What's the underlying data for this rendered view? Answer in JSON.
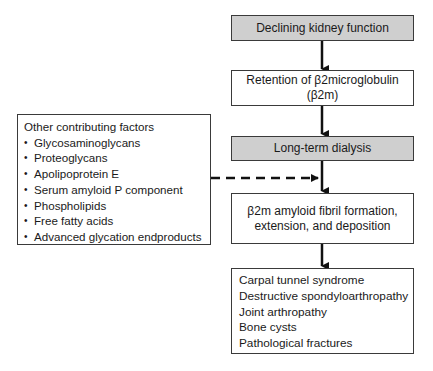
{
  "diagram": {
    "nodes": [
      {
        "id": "declining",
        "label": "Declining kidney function",
        "shaded": true
      },
      {
        "id": "retention",
        "label": "Retention of β2microglobulin (β2m)",
        "lines": [
          "Retention of β2microglobulin",
          "(β2m)"
        ],
        "shaded": false
      },
      {
        "id": "dialysis",
        "label": "Long-term dialysis",
        "shaded": true
      },
      {
        "id": "fibril",
        "label": "β2m amyloid fibril formation, extension, and deposition",
        "lines": [
          "β2m amyloid fibril formation,",
          "extension, and deposition"
        ],
        "shaded": false
      },
      {
        "id": "outcomes",
        "lines": [
          "Carpal tunnel syndrome",
          "Destructive spondyloarthropathy",
          "Joint arthropathy",
          "Bone cysts",
          "Pathological fractures"
        ],
        "shaded": false
      }
    ],
    "factors": {
      "title": "Other contributing factors",
      "items": [
        "Glycosaminoglycans",
        "Proteoglycans",
        "Apolipoprotein E",
        "Serum amyloid P component",
        "Phospholipids",
        "Free fatty acids",
        "Advanced glycation endproducts"
      ]
    },
    "edges": [
      {
        "from": "declining",
        "to": "retention",
        "style": "solid"
      },
      {
        "from": "retention",
        "to": "dialysis",
        "style": "solid"
      },
      {
        "from": "dialysis",
        "to": "fibril",
        "style": "solid"
      },
      {
        "from": "factors",
        "to": "fibril",
        "style": "dashed"
      },
      {
        "from": "fibril",
        "to": "outcomes",
        "style": "solid"
      }
    ],
    "colors": {
      "shaded_fill": "#cfcfcf",
      "border": "#3a3a3a",
      "arrow": "#111111"
    }
  }
}
